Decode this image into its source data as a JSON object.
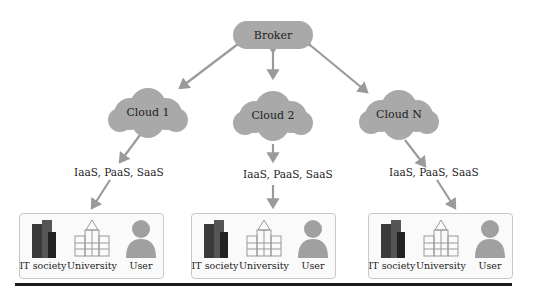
{
  "broker": {
    "label": "Broker"
  },
  "clouds": [
    {
      "label": "Cloud 1"
    },
    {
      "label": "Cloud 2"
    },
    {
      "label": "Cloud N"
    }
  ],
  "services_label": "IaaS, PaaS, SaaS",
  "groups": [
    {
      "entities": [
        {
          "label": "IT society",
          "icon": "building-icon"
        },
        {
          "label": "University",
          "icon": "university-icon"
        },
        {
          "label": "User",
          "icon": "user-icon"
        }
      ]
    },
    {
      "entities": [
        {
          "label": "IT society",
          "icon": "building-icon"
        },
        {
          "label": "University",
          "icon": "university-icon"
        },
        {
          "label": "User",
          "icon": "user-icon"
        }
      ]
    },
    {
      "entities": [
        {
          "label": "IT society",
          "icon": "building-icon"
        },
        {
          "label": "University",
          "icon": "university-icon"
        },
        {
          "label": "User",
          "icon": "user-icon"
        }
      ]
    }
  ],
  "colors": {
    "node_fill": "#a9a9a9",
    "arrow": "#9a9a9a",
    "rule": "#1a1a1a"
  }
}
